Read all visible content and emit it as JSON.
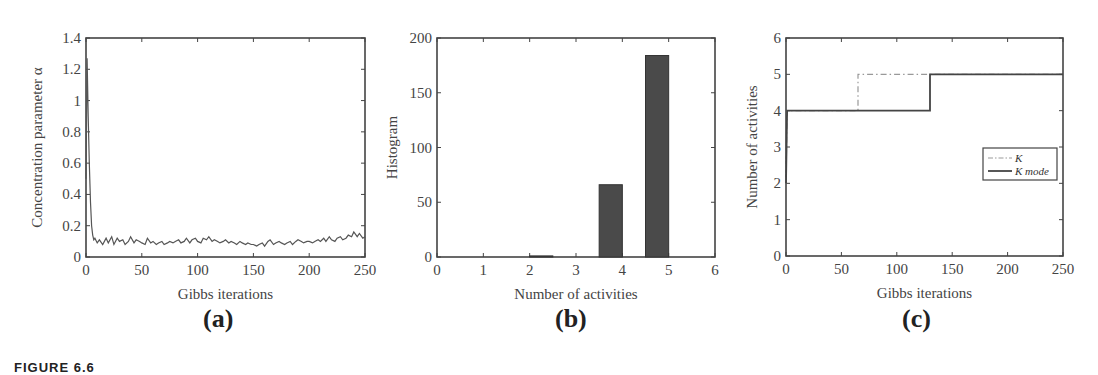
{
  "figure": {
    "caption": "FIGURE 6.6"
  },
  "panels": [
    {
      "id": "a",
      "label": "(a)",
      "xlabel": "Gibbs iterations",
      "ylabel": "Concentration parameter α"
    },
    {
      "id": "b",
      "label": "(b)",
      "xlabel": "Number of activities",
      "ylabel": "Histogram"
    },
    {
      "id": "c",
      "label": "(c)",
      "xlabel": "Gibbs iterations",
      "ylabel": "Number of activities",
      "legend": [
        {
          "label": "K",
          "style": "dash-dot"
        },
        {
          "label": "K mode",
          "style": "solid"
        }
      ]
    }
  ],
  "chart_data": [
    {
      "type": "line",
      "title": "(a)",
      "xlabel": "Gibbs iterations",
      "ylabel": "Concentration parameter α",
      "xlim": [
        0,
        250
      ],
      "ylim": [
        0,
        1.4
      ],
      "xticks": [
        0,
        50,
        100,
        150,
        200,
        250
      ],
      "yticks": [
        0,
        0.2,
        0.4,
        0.6,
        0.8,
        1,
        1.2,
        1.4
      ],
      "grid": false,
      "series": [
        {
          "name": "alpha",
          "x": [
            0,
            1,
            2,
            3,
            4,
            5,
            6,
            7,
            8,
            10,
            12,
            15,
            18,
            20,
            23,
            25,
            28,
            30,
            33,
            35,
            38,
            40,
            43,
            45,
            48,
            50,
            53,
            55,
            58,
            60,
            63,
            65,
            68,
            70,
            73,
            75,
            78,
            80,
            83,
            85,
            88,
            90,
            93,
            95,
            98,
            100,
            103,
            105,
            108,
            110,
            113,
            115,
            118,
            120,
            123,
            125,
            128,
            130,
            133,
            135,
            138,
            140,
            143,
            145,
            148,
            150,
            153,
            155,
            158,
            160,
            163,
            165,
            168,
            170,
            173,
            175,
            178,
            180,
            183,
            185,
            188,
            190,
            193,
            195,
            198,
            200,
            203,
            205,
            208,
            210,
            213,
            215,
            218,
            220,
            223,
            225,
            228,
            230,
            233,
            235,
            238,
            240,
            243,
            245,
            248,
            250
          ],
          "y": [
            0.5,
            1.27,
            0.9,
            0.6,
            0.35,
            0.2,
            0.14,
            0.11,
            0.12,
            0.09,
            0.11,
            0.08,
            0.12,
            0.09,
            0.13,
            0.08,
            0.12,
            0.1,
            0.11,
            0.08,
            0.1,
            0.13,
            0.09,
            0.11,
            0.1,
            0.09,
            0.08,
            0.12,
            0.09,
            0.1,
            0.08,
            0.09,
            0.1,
            0.08,
            0.09,
            0.1,
            0.09,
            0.1,
            0.11,
            0.09,
            0.1,
            0.12,
            0.09,
            0.11,
            0.12,
            0.1,
            0.09,
            0.12,
            0.11,
            0.13,
            0.1,
            0.11,
            0.1,
            0.09,
            0.1,
            0.11,
            0.09,
            0.1,
            0.09,
            0.08,
            0.1,
            0.09,
            0.08,
            0.09,
            0.08,
            0.08,
            0.07,
            0.08,
            0.09,
            0.07,
            0.1,
            0.11,
            0.08,
            0.09,
            0.1,
            0.09,
            0.08,
            0.09,
            0.1,
            0.08,
            0.1,
            0.11,
            0.1,
            0.09,
            0.1,
            0.1,
            0.09,
            0.1,
            0.11,
            0.1,
            0.12,
            0.1,
            0.13,
            0.11,
            0.1,
            0.12,
            0.13,
            0.11,
            0.12,
            0.14,
            0.13,
            0.16,
            0.13,
            0.15,
            0.12,
            0.13
          ]
        }
      ]
    },
    {
      "type": "bar",
      "title": "(b)",
      "xlabel": "Number of activities",
      "ylabel": "Histogram",
      "xlim": [
        0,
        6
      ],
      "ylim": [
        0,
        200
      ],
      "xticks": [
        0,
        1,
        2,
        3,
        4,
        5,
        6
      ],
      "yticks": [
        0,
        50,
        100,
        150,
        200
      ],
      "grid": false,
      "bars": [
        {
          "x0": 2.0,
          "x1": 2.5,
          "value": 1
        },
        {
          "x0": 3.5,
          "x1": 4.0,
          "value": 66
        },
        {
          "x0": 4.5,
          "x1": 5.0,
          "value": 184
        }
      ],
      "categories": [
        "2",
        "4",
        "5"
      ],
      "values": [
        1,
        66,
        184
      ]
    },
    {
      "type": "line",
      "title": "(c)",
      "xlabel": "Gibbs iterations",
      "ylabel": "Number of activities",
      "xlim": [
        0,
        250
      ],
      "ylim": [
        0,
        6
      ],
      "xticks": [
        0,
        50,
        100,
        150,
        200,
        250
      ],
      "yticks": [
        0,
        1,
        2,
        3,
        4,
        5,
        6
      ],
      "grid": false,
      "legend_position": "center right",
      "series": [
        {
          "name": "K",
          "style": "dash-dot",
          "x": [
            0,
            1,
            65,
            65,
            250
          ],
          "y": [
            2,
            4,
            4,
            5,
            5
          ]
        },
        {
          "name": "K mode",
          "style": "solid",
          "x": [
            0,
            1,
            130,
            130,
            250
          ],
          "y": [
            2,
            4,
            4,
            5,
            5
          ]
        }
      ]
    }
  ]
}
